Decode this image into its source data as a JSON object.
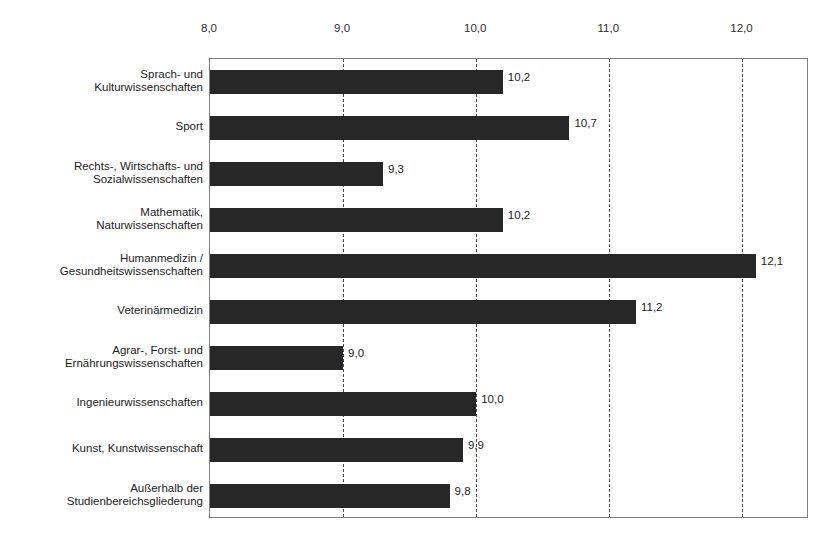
{
  "chart_data": {
    "type": "bar",
    "orientation": "horizontal",
    "title": "",
    "xlabel": "",
    "ylabel": "",
    "xlim": [
      8.0,
      12.5
    ],
    "grid": true,
    "legend": false,
    "decimal_separator": ",",
    "xticks": [
      "8,0",
      "9,0",
      "10,0",
      "11,0",
      "12,0"
    ],
    "xtick_values": [
      8.0,
      9.0,
      10.0,
      11.0,
      12.0
    ],
    "categories": [
      "Sprach- und\nKulturwissenschaften",
      "Sport",
      "Rechts-, Wirtschafts- und\nSozialwissenschaften",
      "Mathematik,\nNaturwissenschaften",
      "Humanmedizin /\nGesundheitswissenschaften",
      "Veterinärmedizin",
      "Agrar-, Forst- und\nErnährungswissenschaften",
      "Ingenieurwissenschaften",
      "Kunst, Kunstwissenschaft",
      "Außerhalb der\nStudienbereichsgliederung"
    ],
    "values": [
      10.2,
      10.7,
      9.3,
      10.2,
      12.1,
      11.2,
      9.0,
      10.0,
      9.9,
      9.8
    ],
    "data_labels": [
      "10,2",
      "10,7",
      "9,3",
      "10,2",
      "12,1",
      "11,2",
      "9,0",
      "10,0",
      "9,9",
      "9,8"
    ],
    "bar_color": "#272727",
    "plot_border_color": "#7d7d7d",
    "gridline_color": "#4a4a4a"
  }
}
